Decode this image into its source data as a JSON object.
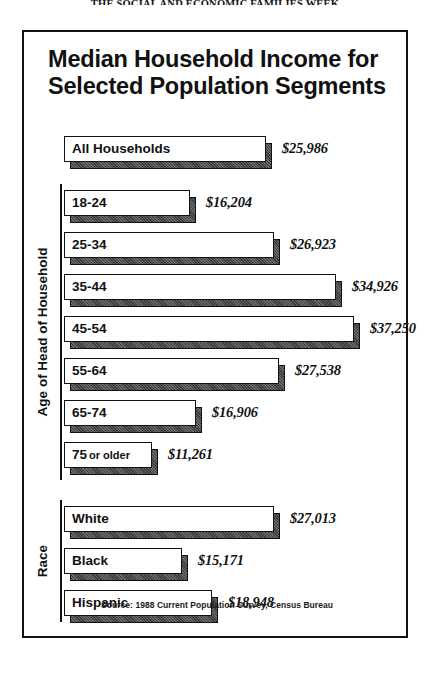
{
  "page_header": "THE SOCIAL AND ECONOMIC FAMILIES WEEK",
  "figure": {
    "title_line1": "Median Household Income for",
    "title_line2": "Selected Population Segments",
    "source_lead": "Source:",
    "source_body": "1988 Current Population Survey, Census Bureau"
  },
  "groups": {
    "age_label": "Age of Head of Household",
    "race_label": "Race"
  },
  "chart_data": {
    "type": "bar",
    "orientation": "horizontal",
    "title": "Median Household Income for Selected Population Segments",
    "xlabel": "",
    "ylabel": "",
    "xlim": [
      0,
      37250
    ],
    "grid": false,
    "legend": "none",
    "value_prefix": "$",
    "annotation": "Source: 1988 Current Population Survey, Census Bureau",
    "categories": [
      "All Households",
      "18-24",
      "25-34",
      "35-44",
      "45-54",
      "55-64",
      "65-74",
      "75 or older",
      "White",
      "Black",
      "Hispanic"
    ],
    "values": [
      25986,
      16204,
      26923,
      34926,
      37250,
      27538,
      16906,
      11261,
      27013,
      15171,
      18948
    ],
    "bars": [
      {
        "label": "All Households",
        "label_main": "All Households",
        "label_small": "",
        "value": 25986,
        "value_text": "$25,986",
        "group": "total"
      },
      {
        "label": "18-24",
        "label_main": "18-24",
        "label_small": "",
        "value": 16204,
        "value_text": "$16,204",
        "group": "age"
      },
      {
        "label": "25-34",
        "label_main": "25-34",
        "label_small": "",
        "value": 26923,
        "value_text": "$26,923",
        "group": "age"
      },
      {
        "label": "35-44",
        "label_main": "35-44",
        "label_small": "",
        "value": 34926,
        "value_text": "$34,926",
        "group": "age"
      },
      {
        "label": "45-54",
        "label_main": "45-54",
        "label_small": "",
        "value": 37250,
        "value_text": "$37,250",
        "group": "age"
      },
      {
        "label": "55-64",
        "label_main": "55-64",
        "label_small": "",
        "value": 27538,
        "value_text": "$27,538",
        "group": "age"
      },
      {
        "label": "65-74",
        "label_main": "65-74",
        "label_small": "",
        "value": 16906,
        "value_text": "$16,906",
        "group": "age"
      },
      {
        "label": "75 or older",
        "label_main": "75",
        "label_small": "or older",
        "value": 11261,
        "value_text": "$11,261",
        "group": "age"
      },
      {
        "label": "White",
        "label_main": "White",
        "label_small": "",
        "value": 27013,
        "value_text": "$27,013",
        "group": "race"
      },
      {
        "label": "Black",
        "label_main": "Black",
        "label_small": "",
        "value": 15171,
        "value_text": "$15,171",
        "group": "race"
      },
      {
        "label": "Hispanic",
        "label_main": "Hispanic",
        "label_small": "",
        "value": 18948,
        "value_text": "$18,948",
        "group": "race"
      }
    ]
  }
}
